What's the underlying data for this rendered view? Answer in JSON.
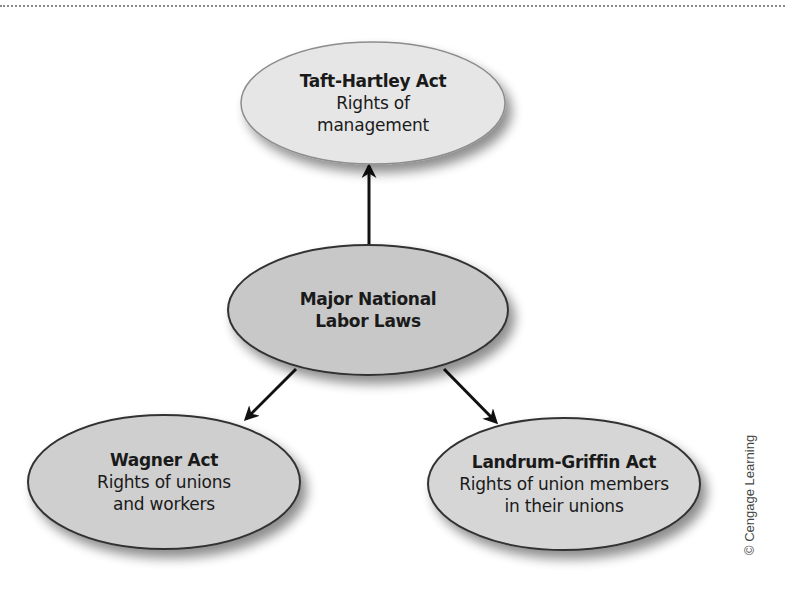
{
  "diagram": {
    "type": "concept-map",
    "center": {
      "title": "Major National",
      "title_line2": "Labor Laws",
      "fill": "#c8c8c8"
    },
    "nodes": [
      {
        "id": "taft-hartley",
        "title": "Taft-Hartley Act",
        "desc_line1": "Rights of",
        "desc_line2": "management",
        "fill": "#e6e6e6",
        "position": "top"
      },
      {
        "id": "wagner",
        "title": "Wagner Act",
        "desc_line1": "Rights of unions",
        "desc_line2": "and workers",
        "fill": "#cfcfcf",
        "position": "bottom-left"
      },
      {
        "id": "landrum-griffin",
        "title": "Landrum-Griffin Act",
        "desc_line1": "Rights of union members",
        "desc_line2": "in their unions",
        "fill": "#d6d6d6",
        "position": "bottom-right"
      }
    ],
    "edges": [
      {
        "from": "center",
        "to": "taft-hartley"
      },
      {
        "from": "center",
        "to": "wagner"
      },
      {
        "from": "center",
        "to": "landrum-griffin"
      }
    ]
  },
  "credit": "© Cengage Learning"
}
